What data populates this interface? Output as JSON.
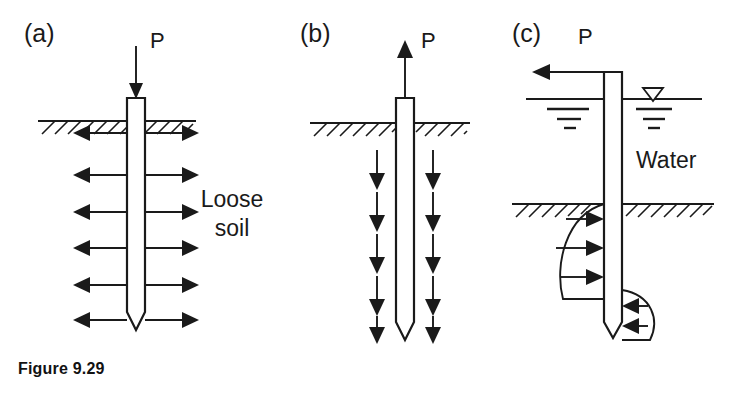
{
  "figure": {
    "caption": "Figure 9.29",
    "caption_position": {
      "x": 18,
      "y": 368
    },
    "background": "#ffffff",
    "ink_color": "#1a1a1a",
    "width": 739,
    "height": 399
  },
  "panels": [
    {
      "id": "a",
      "label": "(a)",
      "label_pos": {
        "x": 24,
        "y": 42
      },
      "description": "Axially loaded compression pile in loose soil with lateral soil reaction arrows pointing outward on both sides",
      "load": {
        "symbol": "P",
        "label_pos": {
          "x": 150,
          "y": 48
        },
        "direction": "down",
        "arrow": {
          "x": 136,
          "y1": 48,
          "y2": 96
        }
      },
      "pile": {
        "cx": 136,
        "top": 98,
        "bottom": 330,
        "half_width": 9,
        "tip_depth": 18,
        "tip_shape": "pointed-v"
      },
      "ground": {
        "y": 121,
        "x1": 38,
        "x2": 196,
        "hatch_count": 13,
        "hatch_len": 13,
        "hatch_gap": 13
      },
      "side_arrows": {
        "direction": "bidirectional-outward",
        "count": 6,
        "ys": [
          133,
          175,
          212,
          248,
          285,
          320
        ],
        "inner_offset": 9,
        "outer_reach": 62
      },
      "annotation": {
        "text_lines": [
          "Loose",
          "soil"
        ],
        "pos": {
          "x": 232,
          "y": 207
        }
      }
    },
    {
      "id": "b",
      "label": "(b)",
      "label_pos": {
        "x": 300,
        "y": 42
      },
      "description": "Uplift (tension) pile with upward applied load and downward skin friction arrows on both sides",
      "load": {
        "symbol": "P",
        "label_pos": {
          "x": 421,
          "y": 48
        },
        "direction": "up",
        "arrow": {
          "x": 405,
          "y1": 98,
          "y2": 46
        }
      },
      "pile": {
        "cx": 405,
        "top": 98,
        "bottom": 340,
        "half_width": 9,
        "tip_depth": 18,
        "tip_shape": "pointed-v"
      },
      "ground": {
        "y": 123,
        "x1": 310,
        "x2": 470,
        "hatch_count": 13,
        "hatch_len": 13,
        "hatch_gap": 13
      },
      "side_arrows": {
        "direction": "down",
        "count": 5,
        "ys": [
          150,
          192,
          234,
          276,
          316
        ],
        "length": 38,
        "left_x": 377,
        "right_x": 433
      }
    },
    {
      "id": "c",
      "label": "(c)",
      "label_pos": {
        "x": 512,
        "y": 42
      },
      "description": "Laterally loaded pile in water with soil reaction pressure distribution bulbs below the mudline",
      "load": {
        "symbol": "P",
        "label_pos": {
          "x": 578,
          "y": 44
        },
        "direction": "left",
        "arrow": {
          "y": 72,
          "x1": 613,
          "x2": 534
        }
      },
      "pile": {
        "cx": 613,
        "top": 72,
        "bottom": 338,
        "half_width": 9,
        "tip_depth": 16,
        "tip_shape": "pointed-v"
      },
      "water": {
        "label": "Water",
        "label_pos": {
          "x": 636,
          "y": 160
        },
        "surface_y": 99,
        "left_x1": 526,
        "left_x2": 605,
        "right_x1": 621,
        "right_x2": 700,
        "wt_triangle": {
          "cx": 653,
          "top_y": 88,
          "half_w": 10,
          "height": 13
        }
      },
      "mudline": {
        "y": 204,
        "x1": 512,
        "x2": 712,
        "hatch_count": 15,
        "hatch_len": 13,
        "hatch_gap": 13
      },
      "pressure_left": {
        "description": "Parabolic soil reaction bulb, arrows pointing right toward pile",
        "top_y": 204,
        "bottom_y": 300,
        "max_bulge": 50,
        "arrow_count": 3,
        "arrow_ys": [
          219,
          248,
          277
        ]
      },
      "pressure_right": {
        "description": "Small reaction bulb near pile tip, arrows pointing left toward pile",
        "top_y": 290,
        "bottom_y": 344,
        "max_bulge": 36,
        "arrow_count": 2,
        "arrow_ys": [
          306,
          326
        ]
      }
    }
  ]
}
